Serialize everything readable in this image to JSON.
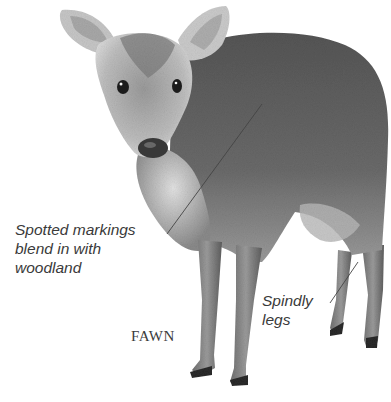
{
  "subject": "fawn",
  "title": "FAWN",
  "annotations": [
    {
      "id": "markings",
      "text": "Spotted markings\nblend in with\nwoodland",
      "pointer": {
        "from": [
          167,
          234
        ],
        "to": [
          262,
          104
        ]
      }
    },
    {
      "id": "legs",
      "text": "Spindly\nlegs",
      "pointer": {
        "from": [
          330,
          303
        ],
        "to": [
          358,
          262
        ]
      }
    }
  ],
  "colors": {
    "background": "#ffffff",
    "label_text": "#3a3a3a",
    "pointer_line": "#444444",
    "fur_dark": "#4a4a4a",
    "fur_mid": "#7c7c7c",
    "fur_light": "#c8c8c8"
  }
}
